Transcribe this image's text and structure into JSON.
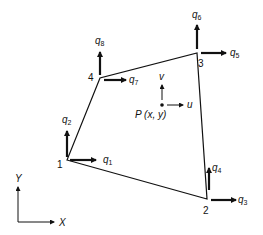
{
  "diagram": {
    "nodes": [
      {
        "id": "1",
        "x": 67,
        "y": 160
      },
      {
        "id": "2",
        "x": 207,
        "y": 199
      },
      {
        "id": "3",
        "x": 197,
        "y": 53
      },
      {
        "id": "4",
        "x": 100,
        "y": 78
      }
    ],
    "node_labels": {
      "n1": "1",
      "n2": "2",
      "n3": "3",
      "n4": "4"
    },
    "dofs": {
      "q1": {
        "base": "q",
        "sub": "1"
      },
      "q2": {
        "base": "q",
        "sub": "2"
      },
      "q3": {
        "base": "q",
        "sub": "3"
      },
      "q4": {
        "base": "q",
        "sub": "4"
      },
      "q5": {
        "base": "q",
        "sub": "5"
      },
      "q6": {
        "base": "q",
        "sub": "6"
      },
      "q7": {
        "base": "q",
        "sub": "7"
      },
      "q8": {
        "base": "q",
        "sub": "8"
      }
    },
    "point": {
      "label": "P (x, y)",
      "u": "u",
      "v": "v"
    },
    "axes": {
      "x": "X",
      "y": "Y"
    }
  }
}
